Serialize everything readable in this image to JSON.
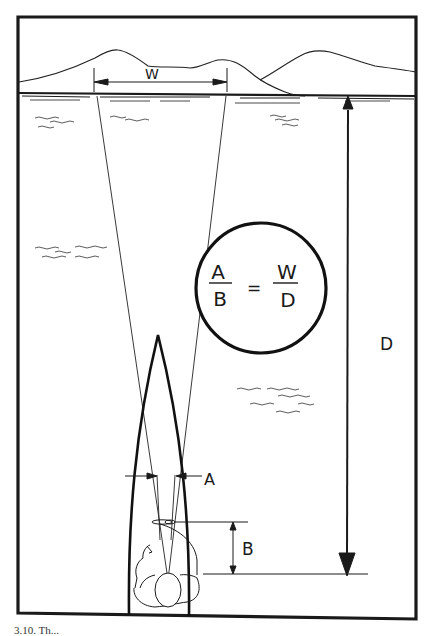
{
  "figure": {
    "type": "navigation-range-estimation-diagram",
    "labels": {
      "width": "W",
      "distance": "D",
      "sight_width": "A",
      "eye_distance": "B"
    },
    "formula": {
      "left_numerator": "A",
      "left_denominator": "B",
      "equals": "=",
      "right_numerator": "W",
      "right_denominator": "D"
    },
    "elements": [
      "mountain-skyline",
      "shoreline",
      "water-ripples",
      "boat-bow",
      "observer",
      "sight-lines",
      "formula-circle"
    ]
  },
  "caption": {
    "text": "3.10. Th..."
  },
  "colors": {
    "ink": "#1a1a1a",
    "paper": "#ffffff"
  }
}
